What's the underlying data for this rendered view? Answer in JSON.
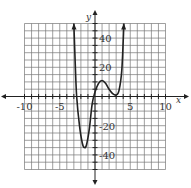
{
  "chart_data": {
    "type": "line",
    "title": "",
    "xlabel": "x",
    "ylabel": "y",
    "xlim": [
      -10,
      10
    ],
    "ylim": [
      -50,
      50
    ],
    "grid": true,
    "x_grid_step": 1,
    "y_grid_step": 5,
    "x_tick_labels": [
      "-10",
      "-5",
      "5",
      "10"
    ],
    "x_tick_values": [
      -10,
      -5,
      5,
      10
    ],
    "y_tick_labels": [
      "40",
      "20",
      "-20",
      "-40"
    ],
    "y_tick_values": [
      40,
      20,
      -20,
      -40
    ],
    "series": [
      {
        "name": "f(x)",
        "arrows_at_ends": true,
        "x": [
          -3.0,
          -2.8,
          -2.6,
          -2.2,
          -1.8,
          -1.5,
          -1.2,
          -0.8,
          -0.4,
          0.0,
          0.5,
          1.0,
          1.5,
          2.0,
          2.5,
          3.0,
          3.4,
          3.8,
          4.1
        ],
        "y": [
          50,
          22,
          0,
          -20,
          -32,
          -35,
          -33,
          -22,
          -5,
          3,
          9,
          11,
          9,
          5,
          2,
          1,
          4,
          18,
          50
        ]
      }
    ],
    "features": {
      "local_min_1": [
        -1.5,
        -35
      ],
      "local_max": [
        1.0,
        11
      ],
      "local_min_2": [
        3.0,
        1
      ],
      "x_intercepts_approx": [
        -2.6,
        -0.3
      ]
    }
  },
  "labels": {
    "x_axis": "x",
    "y_axis": "y",
    "x_ticks": [
      "-10",
      "-5",
      "5",
      "10"
    ],
    "y_ticks": [
      "40",
      "20",
      "-20",
      "-40"
    ]
  }
}
